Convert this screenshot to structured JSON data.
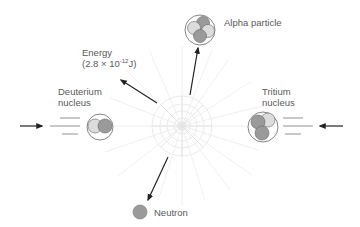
{
  "diagram": {
    "labels": {
      "alpha": "Alpha particle",
      "energy_line1": "Energy",
      "energy_prefix": "(2.8 × 10",
      "energy_exponent": "-12",
      "energy_suffix": "J)",
      "deuterium_line1": "Deuterium",
      "deuterium_line2": "nucleus",
      "tritium_line1": "Tritium",
      "tritium_line2": "nucleus",
      "neutron": "Neutron"
    },
    "colors": {
      "proton": "#dcdcdc",
      "neutron": "#9a9a9a",
      "outline": "#555555",
      "arrow": "#222222",
      "burst": "#e6e6e6",
      "text": "#5a5a5a"
    },
    "particles": {
      "deuterium": {
        "protons": 1,
        "neutrons": 1
      },
      "tritium": {
        "protons": 1,
        "neutrons": 2
      },
      "alpha": {
        "protons": 2,
        "neutrons": 2
      },
      "neutron": {
        "neutrons": 1
      }
    }
  }
}
